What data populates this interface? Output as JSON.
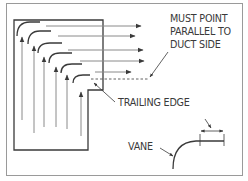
{
  "diagram": {
    "labels": {
      "must_point_line1": "MUST POINT",
      "must_point_line2": "PARALLEL TO",
      "must_point_line3": "DUCT SIDE",
      "trailing_edge": "TRAILING EDGE",
      "vane": "VANE"
    },
    "colors": {
      "line": "#3a3a3a",
      "light_line": "#8a8a8a",
      "frame": "#9a9a9a",
      "background": "#ffffff"
    },
    "vane_count": 7
  }
}
